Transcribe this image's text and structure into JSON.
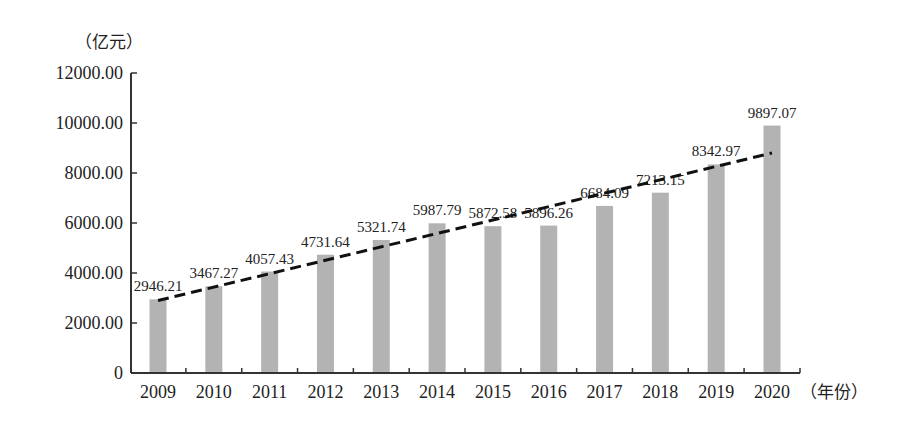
{
  "chart_data": {
    "type": "bar",
    "title": "",
    "ylabel": "（亿元）",
    "xlabel": "（年份）",
    "ylim": [
      0,
      12000
    ],
    "yticks": [
      "0",
      "2000.00",
      "4000.00",
      "6000.00",
      "8000.00",
      "10000.00",
      "12000.00"
    ],
    "ytick_values": [
      0,
      2000,
      4000,
      6000,
      8000,
      10000,
      12000
    ],
    "categories": [
      "2009",
      "2010",
      "2011",
      "2012",
      "2013",
      "2014",
      "2015",
      "2016",
      "2017",
      "2018",
      "2019",
      "2020"
    ],
    "values": [
      2946.21,
      3467.27,
      4057.43,
      4731.64,
      5321.74,
      5987.79,
      5872.58,
      5896.26,
      6684.09,
      7213.15,
      8342.97,
      9897.07
    ],
    "value_labels": [
      "2946.21",
      "3467.27",
      "4057.43",
      "4731.64",
      "5321.74",
      "5987.79",
      "5872.58",
      "5896.26",
      "6684.09",
      "7213.15",
      "8342.97",
      "9897.07"
    ],
    "trendline": {
      "style": "dashed",
      "start": {
        "category": "2009",
        "value": 2900
      },
      "end": {
        "category": "2020",
        "value": 8800
      }
    },
    "grid": false,
    "legend": null,
    "colors": {
      "bar": "#b3b3b3",
      "axis": "#333333",
      "trend": "#111111",
      "text": "#222222"
    }
  }
}
